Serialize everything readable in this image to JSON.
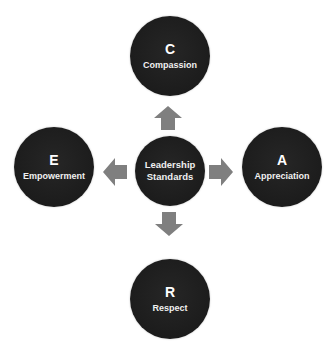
{
  "diagram": {
    "type": "radial hub-and-spoke",
    "center": {
      "line1": "Leadership",
      "line2": "Standards"
    },
    "nodes": {
      "top": {
        "letter": "C",
        "label": "Compassion"
      },
      "right": {
        "letter": "A",
        "label": "Appreciation"
      },
      "bottom": {
        "letter": "R",
        "label": "Respect"
      },
      "left": {
        "letter": "E",
        "label": "Empowerment"
      }
    },
    "arrows": [
      "up",
      "right",
      "down",
      "left"
    ],
    "colors": {
      "circle_fill": "#1e1e1e",
      "text": "#ffffff",
      "arrow_fill": "#7f7f7f",
      "background": "#ffffff"
    }
  }
}
